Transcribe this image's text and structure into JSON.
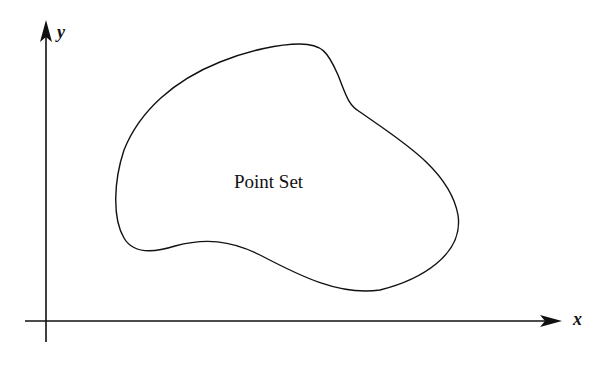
{
  "diagram": {
    "axes": {
      "x_label": "x",
      "y_label": "y"
    },
    "region": {
      "label": "Point Set",
      "shape": "closed-blob"
    },
    "colors": {
      "stroke": "#111111",
      "background": "#ffffff"
    }
  }
}
